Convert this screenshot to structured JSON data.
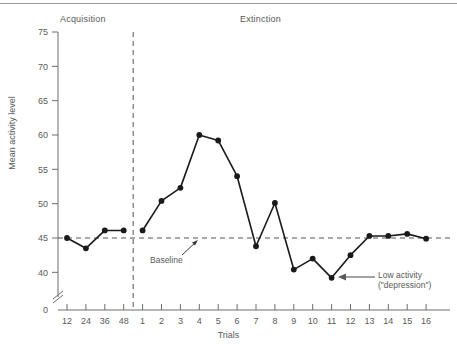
{
  "figure": {
    "phase_labels": {
      "acquisition": "Acquisition",
      "extinction": "Extinction"
    },
    "annotations": {
      "baseline": "Baseline",
      "low_activity_line1": "Low activity",
      "low_activity_line2": "(\"depression\")"
    }
  },
  "chart_data": {
    "type": "line",
    "title": "",
    "xlabel": "Trials",
    "ylabel": "Mean activity level",
    "ylim": [
      38,
      75
    ],
    "y_axis_break": true,
    "y_zero_label": "0",
    "yticks": [
      40,
      45,
      50,
      55,
      60,
      65,
      70,
      75
    ],
    "ytick_labels": [
      "40",
      "45",
      "50",
      "55",
      "60",
      "65",
      "70",
      "75"
    ],
    "x_categories": [
      "12",
      "24",
      "36",
      "48",
      "1",
      "2",
      "3",
      "4",
      "5",
      "6",
      "7",
      "8",
      "9",
      "10",
      "11",
      "12",
      "13",
      "14",
      "15",
      "16"
    ],
    "grid": false,
    "legend": "none",
    "marker": "filled-circle",
    "line_color": "#1a1a1a",
    "baseline_value": 45,
    "baseline_style": "dashed",
    "phase_divider_after_index": 3,
    "phase_divider_style": "dashed",
    "series": [
      {
        "name": "Mean activity level",
        "values": [
          45.0,
          43.5,
          46.1,
          46.1,
          46.1,
          50.4,
          52.3,
          60.0,
          59.2,
          54.0,
          43.8,
          50.1,
          40.4,
          42.0,
          39.2,
          42.5,
          45.3,
          45.3,
          45.6,
          44.9
        ]
      }
    ],
    "points": [
      {
        "trial": "12",
        "phase": "Acquisition",
        "value": 45.0
      },
      {
        "trial": "24",
        "phase": "Acquisition",
        "value": 43.5
      },
      {
        "trial": "36",
        "phase": "Acquisition",
        "value": 46.1
      },
      {
        "trial": "48",
        "phase": "Acquisition",
        "value": 46.1
      },
      {
        "trial": "1",
        "phase": "Extinction",
        "value": 46.1
      },
      {
        "trial": "2",
        "phase": "Extinction",
        "value": 50.4
      },
      {
        "trial": "3",
        "phase": "Extinction",
        "value": 52.3
      },
      {
        "trial": "4",
        "phase": "Extinction",
        "value": 60.0
      },
      {
        "trial": "5",
        "phase": "Extinction",
        "value": 59.2
      },
      {
        "trial": "6",
        "phase": "Extinction",
        "value": 54.0
      },
      {
        "trial": "7",
        "phase": "Extinction",
        "value": 43.8
      },
      {
        "trial": "8",
        "phase": "Extinction",
        "value": 50.1
      },
      {
        "trial": "9",
        "phase": "Extinction",
        "value": 40.4
      },
      {
        "trial": "10",
        "phase": "Extinction",
        "value": 42.0
      },
      {
        "trial": "11",
        "phase": "Extinction",
        "value": 39.2
      },
      {
        "trial": "12",
        "phase": "Extinction",
        "value": 42.5
      },
      {
        "trial": "13",
        "phase": "Extinction",
        "value": 45.3
      },
      {
        "trial": "14",
        "phase": "Extinction",
        "value": 45.3
      },
      {
        "trial": "15",
        "phase": "Extinction",
        "value": 45.6
      },
      {
        "trial": "16",
        "phase": "Extinction",
        "value": 44.9
      }
    ]
  }
}
